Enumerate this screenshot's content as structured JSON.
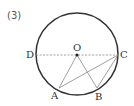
{
  "problem_number": "(3)",
  "diagram": {
    "circle": {
      "cx": 77,
      "cy": 54,
      "r": 41,
      "stroke": "#333333"
    },
    "points": {
      "O": {
        "label": "O",
        "x": 77,
        "y": 55
      },
      "D": {
        "label": "D",
        "x": 36,
        "y": 55
      },
      "C": {
        "label": "C",
        "x": 118,
        "y": 55
      },
      "A": {
        "label": "A",
        "x": 59,
        "y": 88
      },
      "B": {
        "label": "B",
        "x": 97,
        "y": 88
      }
    },
    "segments": [
      "DC (dashed diameter)",
      "OA",
      "OB",
      "AC",
      "BC"
    ],
    "line_color": "#777777"
  }
}
